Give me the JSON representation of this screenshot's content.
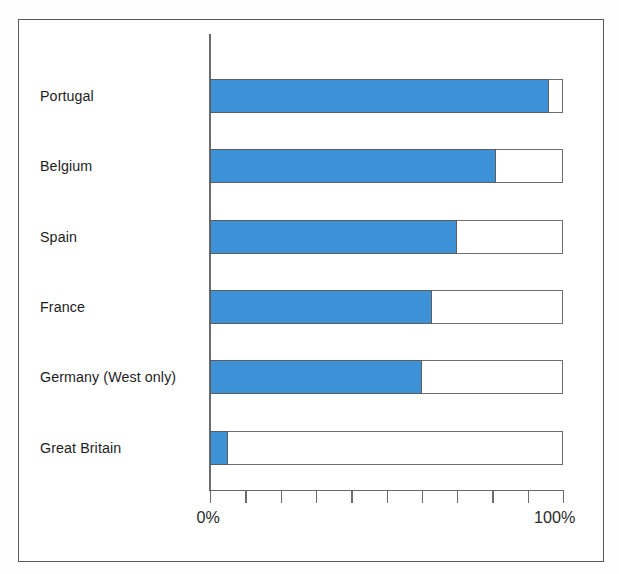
{
  "chart_data": {
    "type": "bar",
    "orientation": "horizontal",
    "stacked": true,
    "title": "",
    "subtitle": "",
    "xlabel": "",
    "ylabel": "",
    "xlim": [
      0,
      100
    ],
    "xtick_labels": [
      "0%",
      "100%"
    ],
    "xticks_values": [
      0,
      10,
      20,
      30,
      40,
      50,
      60,
      70,
      80,
      90,
      100
    ],
    "grid": false,
    "legend": null,
    "categories": [
      "Portugal",
      "Belgium",
      "Spain",
      "France",
      "Germany (West only)",
      "Great Britain"
    ],
    "series": [
      {
        "name": "filled",
        "color": "#3d91d6",
        "values": [
          96,
          81,
          70,
          63,
          60,
          5
        ]
      },
      {
        "name": "remainder",
        "color": "#ffffff",
        "values": [
          4,
          19,
          30,
          37,
          40,
          95
        ]
      }
    ],
    "annotations": []
  },
  "axis": {
    "min_label": "0%",
    "max_label": "100%"
  },
  "colors": {
    "bar_fill": "#3d91d6",
    "bar_outline": "#6e6e6e",
    "axis": "#6b6b6b",
    "frame": "#5a5a5a",
    "text": "#1d1d1d",
    "background": "#ffffff"
  }
}
